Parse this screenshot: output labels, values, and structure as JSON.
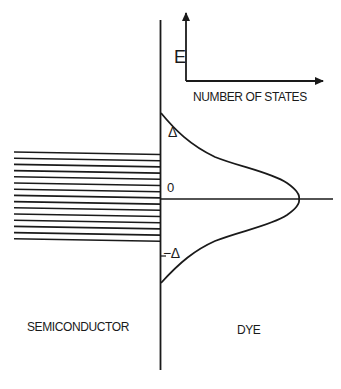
{
  "diagram": {
    "title": "",
    "axes_inset": {
      "y_label": "E",
      "x_label": "NUMBER OF STATES"
    },
    "energy_zero_label": "0",
    "upper_offset_label": "Δ",
    "lower_offset_label": "−Δ",
    "regions": {
      "left": "SEMICONDUCTOR",
      "right": "DYE"
    },
    "semiconductor_band_lines": 15,
    "curve": "gaussian density of states centered at E = 0, spanning from Δ to −Δ",
    "colors": {
      "ink": "#1a1a1a",
      "background": "#ffffff"
    }
  }
}
